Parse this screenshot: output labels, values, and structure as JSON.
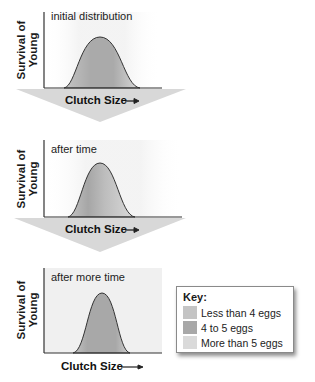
{
  "panels": [
    {
      "title": "initial distribution",
      "ylabel_line1": "Survival of",
      "ylabel_line2": "Young",
      "xlabel": "Clutch Size"
    },
    {
      "title": "after time",
      "ylabel_line1": "Survival of",
      "ylabel_line2": "Young",
      "xlabel": "Clutch Size"
    },
    {
      "title": "after more time",
      "ylabel_line1": "Survival of",
      "ylabel_line2": "Young",
      "xlabel": "Clutch Size"
    }
  ],
  "key": {
    "title": "Key:",
    "items": [
      {
        "label": "Less than 4 eggs",
        "color": "#c4c4c4"
      },
      {
        "label": "4 to 5 eggs",
        "color": "#a8a8a8"
      },
      {
        "label": "More than 5 eggs",
        "color": "#dadada"
      }
    ]
  },
  "colors": {
    "arrow": "#d9d9d9",
    "panel_bg": "#f3f3f3",
    "curve_line": "#333333",
    "center_fill": "#a8a8a8",
    "left_fill": "#c4c4c4",
    "right_fill": "#dadada"
  }
}
